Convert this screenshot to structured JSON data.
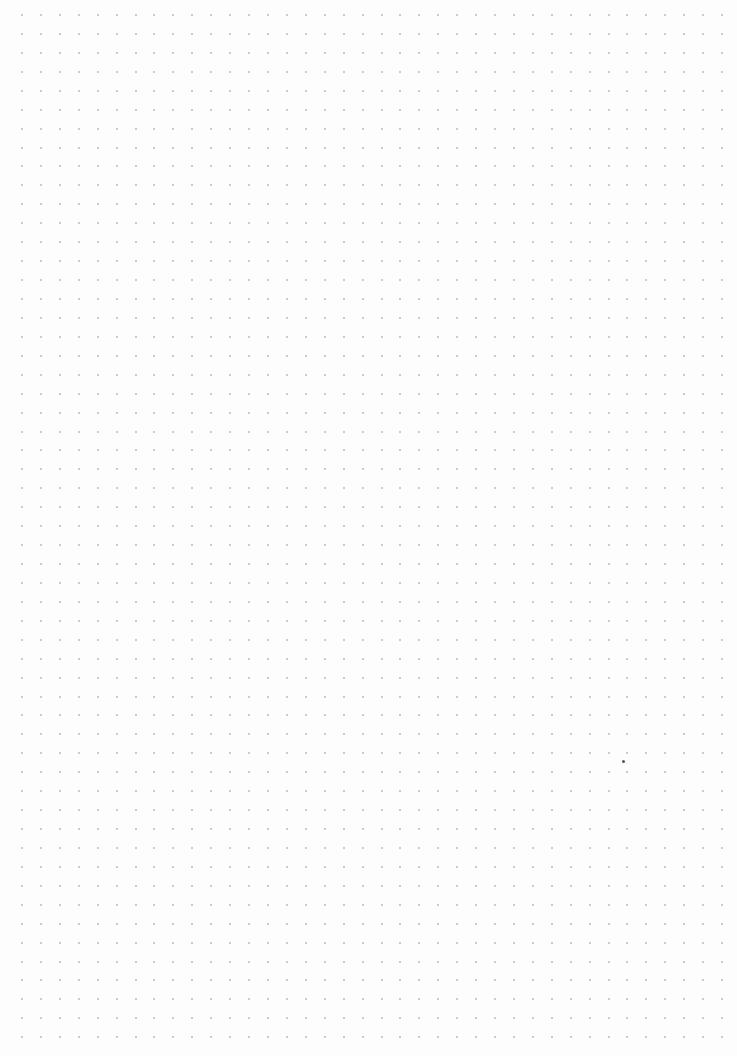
{
  "page": {
    "type": "dot-grid-paper",
    "background_color": "#fdfdfd",
    "dot_color": "#b8b8b8",
    "grid": {
      "origin_x": 22,
      "origin_y": 15,
      "spacing_x": 18.92,
      "spacing_y": 18.93,
      "columns": 38,
      "rows": 55
    },
    "stray_mark": {
      "x": 623,
      "y": 761,
      "color": "#555555"
    }
  }
}
